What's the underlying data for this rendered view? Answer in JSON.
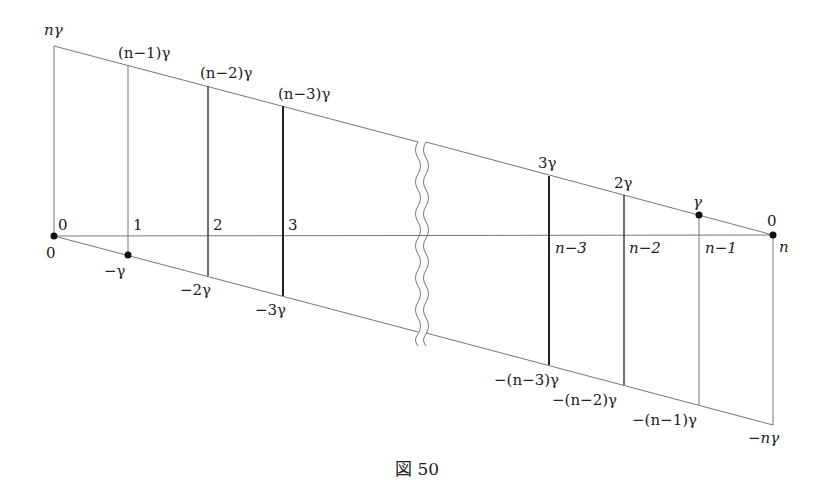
{
  "figure": {
    "caption": "図 50",
    "top_labels": {
      "left_corner": "nγ",
      "v1": "(n−1)γ",
      "v2": "(n−2)γ",
      "v3": "(n−3)γ",
      "vn3": "3γ",
      "vn2": "2γ",
      "vn1": "γ",
      "right_corner": "0"
    },
    "axis_labels": {
      "left_top": "0",
      "left_bottom": "0",
      "t1": "1",
      "t2": "2",
      "t3": "3",
      "tn3": "n−3",
      "tn2": "n−2",
      "tn1": "n−1",
      "tn": "n"
    },
    "bottom_labels": {
      "v1": "−γ",
      "v2": "−2γ",
      "v3": "−3γ",
      "vn3": "−(n−3)γ",
      "vn2": "−(n−2)γ",
      "vn1": "−(n−1)γ",
      "right_corner": "−nγ"
    }
  }
}
